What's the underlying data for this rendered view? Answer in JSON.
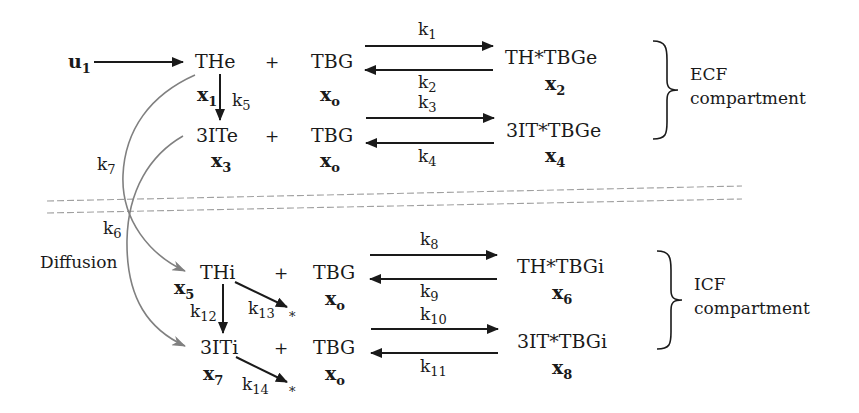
{
  "diagram": {
    "type": "compartmental reaction scheme",
    "input": {
      "symbol": "u",
      "sub": "1"
    },
    "ecf": {
      "label_line1": "ECF",
      "label_line2": "compartment",
      "reactions": [
        {
          "reactant": "THe",
          "reactant_var": {
            "symbol": "x",
            "sub": "1"
          },
          "plus": "+",
          "binder": "TBG",
          "binder_var": {
            "symbol": "x",
            "sub": "o"
          },
          "forward_rate": {
            "symbol": "k",
            "sub": "1"
          },
          "reverse_rate": {
            "symbol": "k",
            "sub": "2"
          },
          "complex": "TH*TBGe",
          "complex_var": {
            "symbol": "x",
            "sub": "2"
          }
        },
        {
          "reactant": "3ITe",
          "reactant_var": {
            "symbol": "x",
            "sub": "3"
          },
          "plus": "+",
          "binder": "TBG",
          "binder_var": {
            "symbol": "x",
            "sub": "o"
          },
          "forward_rate": {
            "symbol": "k",
            "sub": "3"
          },
          "reverse_rate": {
            "symbol": "k",
            "sub": "4"
          },
          "complex": "3IT*TBGe",
          "complex_var": {
            "symbol": "x",
            "sub": "4"
          }
        }
      ],
      "conversion_rate": {
        "symbol": "k",
        "sub": "5"
      }
    },
    "transport": {
      "label": "Diffusion",
      "rate_a": {
        "symbol": "k",
        "sub": "7"
      },
      "rate_b": {
        "symbol": "k",
        "sub": "6"
      }
    },
    "icf": {
      "label_line1": "ICF",
      "label_line2": "compartment",
      "reactions": [
        {
          "reactant": "THi",
          "reactant_var": {
            "symbol": "x",
            "sub": "5"
          },
          "plus": "+",
          "binder": "TBG",
          "binder_var": {
            "symbol": "x",
            "sub": "o"
          },
          "forward_rate": {
            "symbol": "k",
            "sub": "8"
          },
          "reverse_rate": {
            "symbol": "k",
            "sub": "9"
          },
          "complex": "TH*TBGi",
          "complex_var": {
            "symbol": "x",
            "sub": "6"
          }
        },
        {
          "reactant": "3ITi",
          "reactant_var": {
            "symbol": "x",
            "sub": "7"
          },
          "plus": "+",
          "binder": "TBG",
          "binder_var": {
            "symbol": "x",
            "sub": "o"
          },
          "forward_rate": {
            "symbol": "k",
            "sub": "10"
          },
          "reverse_rate": {
            "symbol": "k",
            "sub": "11"
          },
          "complex": "3IT*TBGi",
          "complex_var": {
            "symbol": "x",
            "sub": "8"
          }
        }
      ],
      "conversion_rate": {
        "symbol": "k",
        "sub": "12"
      },
      "elimination_th": {
        "symbol": "k",
        "sub": "13",
        "sink": "*"
      },
      "elimination_3it": {
        "symbol": "k",
        "sub": "14",
        "sink": "*"
      }
    },
    "colors": {
      "ink": "#1a1a1a",
      "transport_curve": "#808080",
      "boundary_dash": "#a0a0a0",
      "background": "#ffffff"
    }
  }
}
